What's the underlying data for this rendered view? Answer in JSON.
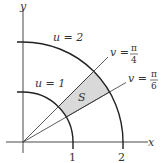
{
  "diagram": {
    "axes": {
      "x_label": "x",
      "y_label": "y"
    },
    "ticks": {
      "x1": "1",
      "x2": "2"
    },
    "arcs": [
      {
        "label": "u = 1",
        "radius": 1
      },
      {
        "label": "u = 2",
        "radius": 2
      }
    ],
    "rays": [
      {
        "label_prefix": "v =",
        "numerator": "π",
        "denominator": "4",
        "angle": "π/4"
      },
      {
        "label_prefix": "v =",
        "numerator": "π",
        "denominator": "6",
        "angle": "π/6"
      }
    ],
    "region": {
      "label": "S",
      "fill": "#d9d9d9"
    },
    "colors": {
      "stroke": "#333333",
      "region": "#d9d9d9"
    }
  }
}
